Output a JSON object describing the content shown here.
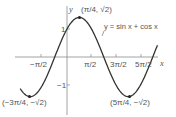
{
  "chart_data": {
    "type": "line",
    "title": "",
    "xlabel": "x",
    "ylabel": "y",
    "series": [
      {
        "name": "y = sin x + cos x",
        "function": "sin(x)+cos(x)",
        "x_range": [
          -3.0,
          5.8
        ]
      }
    ],
    "x_ticks": [
      "−π/2",
      "π/2",
      "3π/2",
      "5π/2"
    ],
    "x_tick_values": [
      -1.5708,
      1.5708,
      4.7124,
      7.854
    ],
    "y_ticks": [
      "1",
      "−1"
    ],
    "y_tick_values": [
      1,
      -1
    ],
    "annotations": [
      {
        "label": "(π/4, √2)",
        "x": 0.7854,
        "y": 1.4142
      },
      {
        "label": "(−3π/4, −√2)",
        "x": -2.3562,
        "y": -1.4142
      },
      {
        "label": "(5π/4, −√2)",
        "x": 3.927,
        "y": -1.4142
      },
      {
        "label": "y = sin x + cos x",
        "type": "curve-label"
      }
    ],
    "grid": false,
    "legend": "none"
  },
  "labels": {
    "x_axis": "x",
    "y_axis": "y",
    "tick_neg_pi_2": "−π/2",
    "tick_pi_2": "π/2",
    "tick_3pi_2": "3π/2",
    "tick_5pi_2": "5π/2",
    "tick_y1": "1",
    "tick_ym1": "−1",
    "peak": "(π/4, √2)",
    "min_left": "(−3π/4, −√2)",
    "min_right": "(5π/4, −√2)",
    "curve": "y = sin x + cos x"
  },
  "colors": {
    "curve": "#333333",
    "axis": "#888888",
    "text": "#555555"
  }
}
